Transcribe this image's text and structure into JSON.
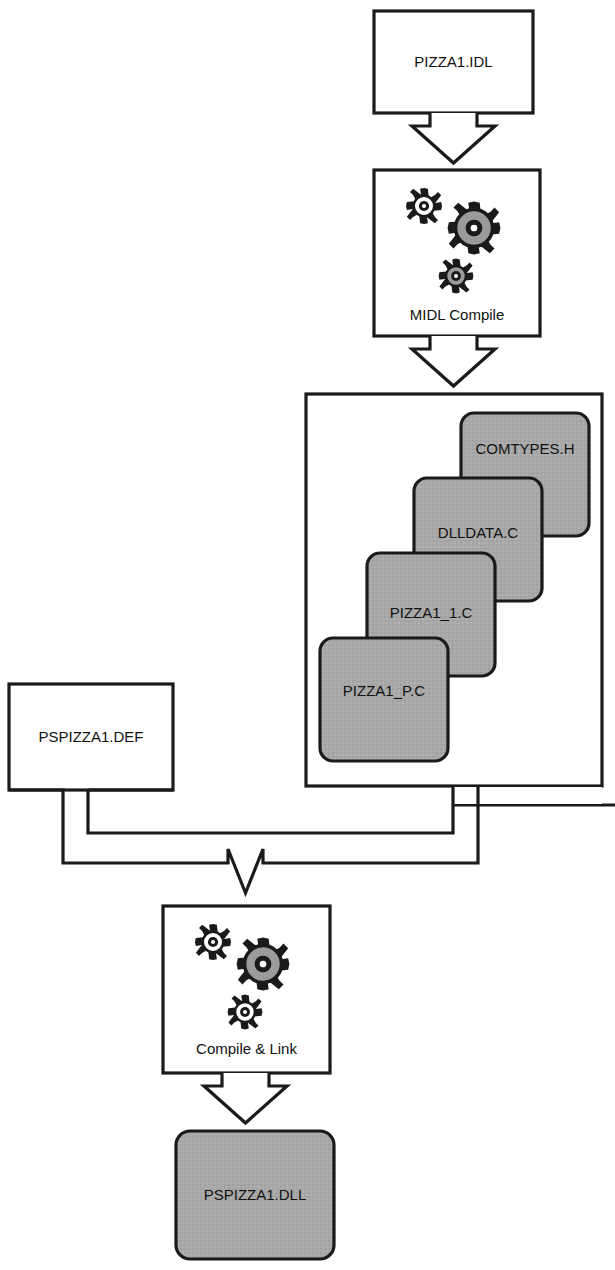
{
  "diagram": {
    "type": "flowchart",
    "colors": {
      "stroke": "#1a1a1a",
      "fill_white": "#ffffff",
      "fill_gray": "#a8a8a8",
      "gear_gray": "#9d9d9d",
      "text": "#111111"
    },
    "nodes": [
      {
        "id": "idl",
        "label": "PIZZA1.IDL",
        "shape": "rect",
        "fill": "white"
      },
      {
        "id": "midl",
        "label": "MIDL Compile",
        "shape": "process-box",
        "fill": "white",
        "icon": "gears-icon"
      },
      {
        "id": "comtypes",
        "label": "COMTYPES.H",
        "shape": "rounded-rect",
        "fill": "gray"
      },
      {
        "id": "dlldata",
        "label": "DLLDATA.C",
        "shape": "rounded-rect",
        "fill": "gray"
      },
      {
        "id": "pizza1_1",
        "label": "PIZZA1_1.C",
        "shape": "rounded-rect",
        "fill": "gray"
      },
      {
        "id": "pizza1_p",
        "label": "PIZZA1_P.C",
        "shape": "rounded-rect",
        "fill": "gray"
      },
      {
        "id": "group",
        "label": "",
        "shape": "container",
        "fill": "white"
      },
      {
        "id": "def",
        "label": "PSPIZZA1.DEF",
        "shape": "rect",
        "fill": "white"
      },
      {
        "id": "complink",
        "label": "Compile & Link",
        "shape": "process-box",
        "fill": "white",
        "icon": "gears-icon"
      },
      {
        "id": "dll",
        "label": "PSPIZZA1.DLL",
        "shape": "rounded-rect",
        "fill": "gray"
      }
    ],
    "edges": [
      {
        "from": "idl",
        "to": "midl",
        "style": "block-arrow-down"
      },
      {
        "from": "midl",
        "to": "group",
        "style": "block-arrow-down"
      },
      {
        "from": "group",
        "to": "complink",
        "style": "block-arrow-merge"
      },
      {
        "from": "def",
        "to": "complink",
        "style": "block-arrow-merge"
      },
      {
        "from": "complink",
        "to": "dll",
        "style": "block-arrow-down"
      }
    ]
  },
  "labels": {
    "idl": "PIZZA1.IDL",
    "midl": "MIDL Compile",
    "comtypes": "COMTYPES.H",
    "dlldata": "DLLDATA.C",
    "pizza1_1": "PIZZA1_1.C",
    "pizza1_p": "PIZZA1_P.C",
    "def": "PSPIZZA1.DEF",
    "complink": "Compile & Link",
    "dll": "PSPIZZA1.DLL"
  }
}
